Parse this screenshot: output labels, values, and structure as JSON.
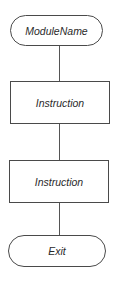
{
  "diagram": {
    "type": "flowchart",
    "nodes": [
      {
        "id": "start",
        "shape": "terminator",
        "label": "ModuleName"
      },
      {
        "id": "step1",
        "shape": "process",
        "label": "Instruction"
      },
      {
        "id": "step2",
        "shape": "process",
        "label": "Instruction"
      },
      {
        "id": "end",
        "shape": "terminator",
        "label": "Exit"
      }
    ],
    "edges": [
      {
        "from": "start",
        "to": "step1"
      },
      {
        "from": "step1",
        "to": "step2"
      },
      {
        "from": "step2",
        "to": "end"
      }
    ],
    "colors": {
      "stroke": "#4a4a4a",
      "text": "#2a2a2a",
      "background": "#ffffff"
    }
  }
}
